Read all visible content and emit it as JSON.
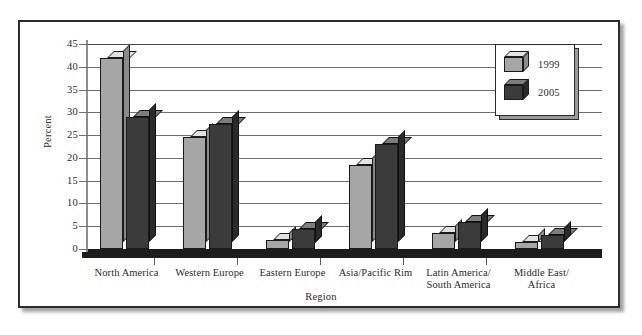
{
  "chart_data": {
    "type": "bar",
    "title": "",
    "xlabel": "Region",
    "ylabel": "Percent",
    "ylim": [
      0,
      45
    ],
    "yticks": [
      0,
      5,
      10,
      15,
      20,
      25,
      30,
      35,
      40,
      45
    ],
    "ytick_labels": [
      "0",
      "5",
      "10",
      "15",
      "20",
      "25",
      "30",
      "35",
      "40",
      "45"
    ],
    "grid": true,
    "legend_position": "top-right",
    "style": "3d-clustered-bar",
    "categories": [
      "North America",
      "Western Europe",
      "Eastern Europe",
      "Asia/Pacific Rim",
      "Latin America/\nSouth America",
      "Middle East/\nAfrica"
    ],
    "category_lines": [
      [
        "North America"
      ],
      [
        "Western Europe"
      ],
      [
        "Eastern Europe"
      ],
      [
        "Asia/Pacific Rim"
      ],
      [
        "Latin America/",
        "South America"
      ],
      [
        "Middle East/",
        "Africa"
      ]
    ],
    "series": [
      {
        "name": "1999",
        "color": "#a6a6a6",
        "values": [
          42,
          24.5,
          2,
          18.5,
          3.5,
          1.5
        ]
      },
      {
        "name": "2005",
        "color": "#3b3b3b",
        "values": [
          29,
          27.5,
          4.5,
          23,
          6,
          3
        ]
      }
    ]
  },
  "legend": {
    "entries": [
      {
        "label": "1999",
        "swatch": "light-cube-icon"
      },
      {
        "label": "2005",
        "swatch": "dark-cube-icon"
      }
    ]
  },
  "axes": {
    "y_title": "Percent",
    "x_title": "Region"
  }
}
